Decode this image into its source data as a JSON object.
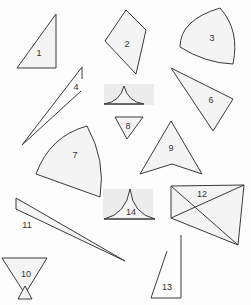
{
  "figure": {
    "shapes": [
      {
        "id": "1",
        "label": "1",
        "kind": "right-triangle"
      },
      {
        "id": "2",
        "label": "2",
        "kind": "kite-quadrilateral"
      },
      {
        "id": "3",
        "label": "3",
        "kind": "curved-triangle-reuleaux"
      },
      {
        "id": "4",
        "label": "4",
        "kind": "thin-sliver-triangle"
      },
      {
        "id": "5",
        "label": "",
        "kind": "concave-cusp-triangle"
      },
      {
        "id": "6",
        "label": "6",
        "kind": "obtuse-triangle"
      },
      {
        "id": "7",
        "label": "7",
        "kind": "circular-sector"
      },
      {
        "id": "8",
        "label": "8",
        "kind": "inverted-triangle"
      },
      {
        "id": "9",
        "label": "9",
        "kind": "concave-arrowhead"
      },
      {
        "id": "10",
        "label": "10",
        "kind": "hourglass-triangles"
      },
      {
        "id": "11",
        "label": "11",
        "kind": "long-thin-triangle"
      },
      {
        "id": "12",
        "label": "12",
        "kind": "crossed-quadrilateral"
      },
      {
        "id": "13",
        "label": "13",
        "kind": "open-right-triangle"
      },
      {
        "id": "14",
        "label": "14",
        "kind": "concave-cusp-triangle"
      }
    ]
  }
}
